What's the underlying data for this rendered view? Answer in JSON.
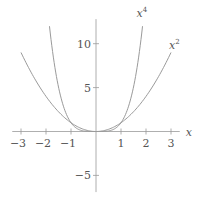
{
  "chart_data": {
    "type": "line",
    "title": "",
    "xlabel": "x",
    "ylabel": "",
    "xlim": [
      -3.35,
      3.35
    ],
    "ylim": [
      -6.9,
      12.8
    ],
    "grid": false,
    "legend": "none (inline curve labels)",
    "x_ticks": [
      -3,
      -2,
      -1,
      1,
      2,
      3
    ],
    "x_tick_labels": [
      "−3",
      "−2",
      "−1",
      "1",
      "2",
      "3"
    ],
    "y_ticks": [
      10,
      5,
      -5
    ],
    "y_tick_labels": [
      "10",
      "5",
      "−5"
    ],
    "series": [
      {
        "name": "x^2",
        "label_base": "x",
        "label_exp": "2",
        "function": "x^2",
        "domain": [
          -3,
          3
        ],
        "x": [
          -3,
          -2,
          -1,
          0,
          1,
          2,
          3
        ],
        "values": [
          9,
          4,
          1,
          0,
          1,
          4,
          9
        ]
      },
      {
        "name": "x^4",
        "label_base": "x",
        "label_exp": "4",
        "function": "x^4",
        "domain": [
          -1.861,
          1.861
        ],
        "x": [
          -1.861,
          -1.5,
          -1,
          0,
          1,
          1.5,
          1.861
        ],
        "values": [
          12,
          5.06,
          1,
          0,
          1,
          5.06,
          12
        ]
      }
    ],
    "colors": {
      "axis": "#9a9a9a",
      "curve": "#9a9a9a",
      "text": "#555555"
    }
  }
}
